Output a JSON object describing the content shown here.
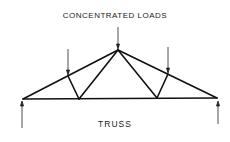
{
  "diagram": {
    "title_top": "CONCENTRATED LOADS",
    "caption": "TRUSS",
    "stroke_color": "#111111",
    "nodes": {
      "left_support": [
        23,
        99
      ],
      "right_support": [
        217,
        98
      ],
      "apex": [
        118,
        50
      ],
      "left_panel_point": [
        68,
        76
      ],
      "right_panel_point": [
        168,
        74
      ],
      "left_bottom_joint": [
        79,
        99
      ],
      "right_bottom_joint": [
        157,
        98
      ]
    },
    "loads": [
      {
        "name": "left-load",
        "x": 68,
        "y_from": 49,
        "y_to": 75
      },
      {
        "name": "apex-load",
        "x": 118,
        "y_from": 27,
        "y_to": 49
      },
      {
        "name": "right-load",
        "x": 168,
        "y_from": 47,
        "y_to": 73
      }
    ],
    "reactions": [
      {
        "name": "left-reaction",
        "x": 22,
        "y_from": 128,
        "y_to": 101
      },
      {
        "name": "right-reaction",
        "x": 218,
        "y_from": 124,
        "y_to": 101
      }
    ]
  }
}
